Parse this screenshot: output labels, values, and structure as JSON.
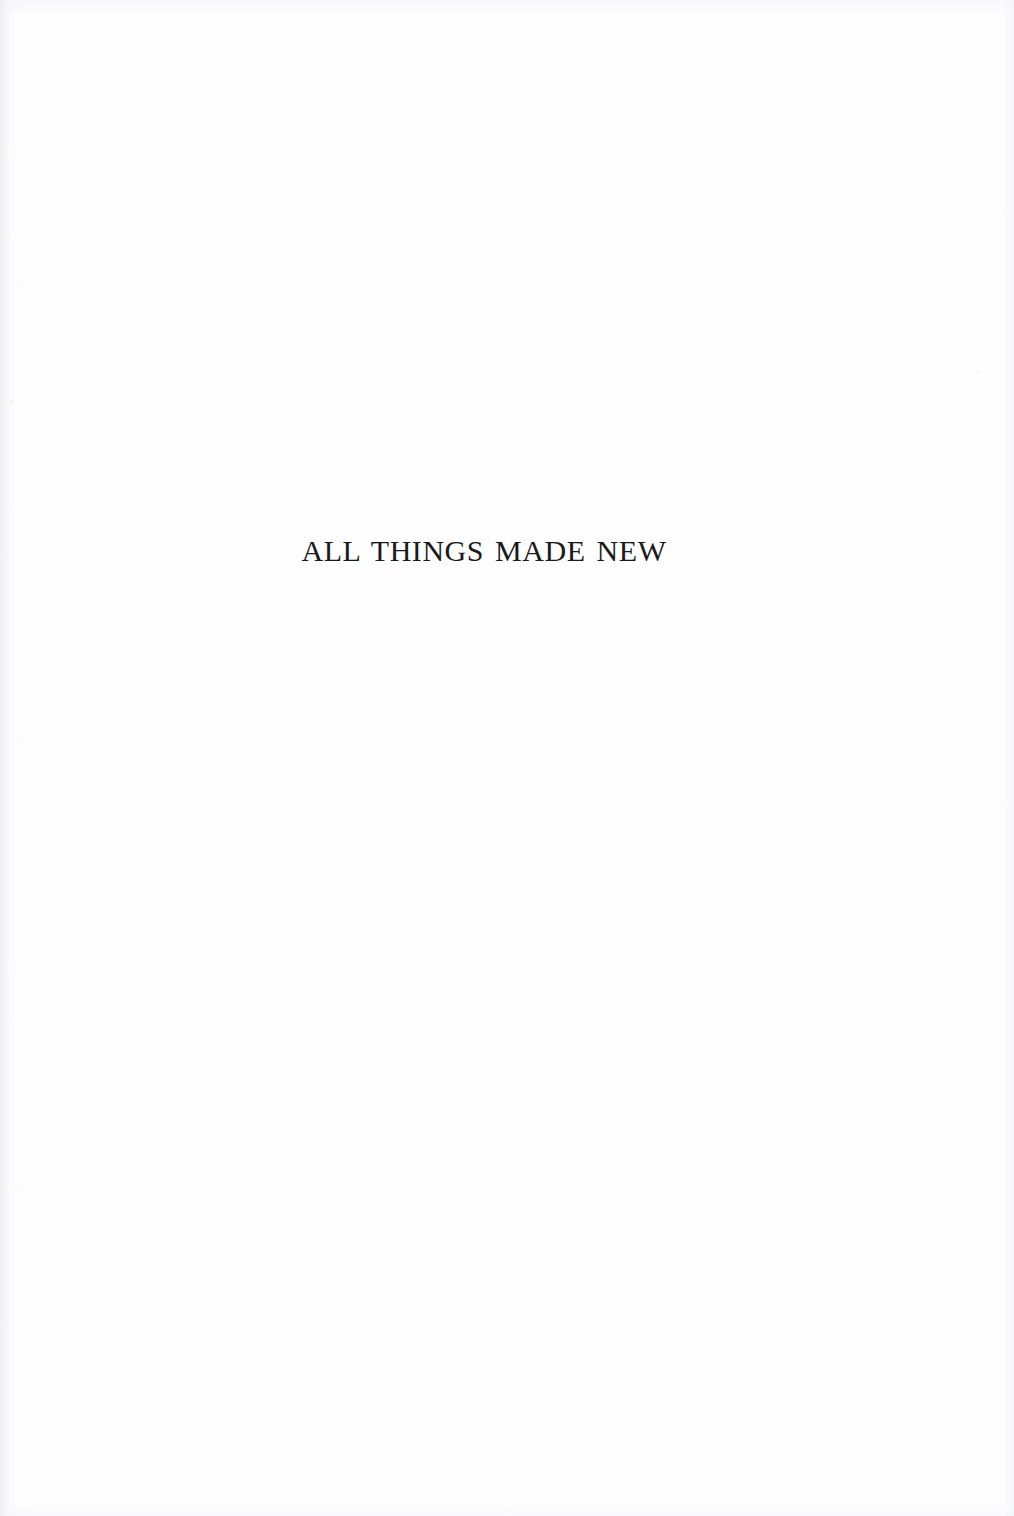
{
  "document": {
    "page_type": "half-title",
    "background_color": "#fefeff",
    "ink_color": "#191920"
  },
  "title_block": {
    "half_title": "ALL THINGS MADE NEW"
  },
  "page_furniture": {
    "header": "",
    "footer": "",
    "folio": ""
  },
  "artifacts": {
    "left_gutter_shading": "scan-edge-left",
    "right_edge_shading": "scan-edge-right",
    "top_edge_shading": "scan-edge-top",
    "bottom_edge_shading": "scan-edge-bottom",
    "speckle_noise": "scan-speckle"
  }
}
